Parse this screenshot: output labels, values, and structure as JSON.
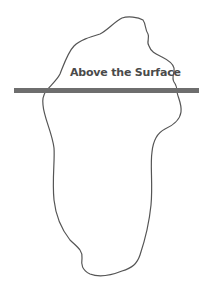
{
  "diagram": {
    "type": "iceberg",
    "label": "Above the Surface",
    "colors": {
      "outline": "#555555",
      "waterline": "#6e6e6e",
      "text": "#4a4a4a",
      "background": "#ffffff"
    },
    "waterline": {
      "x1": 14,
      "x2": 199,
      "y": 90,
      "thickness": 5
    }
  }
}
